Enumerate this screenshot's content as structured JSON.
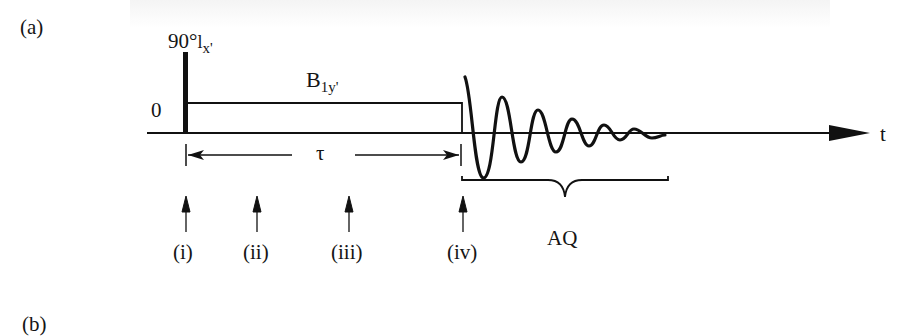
{
  "figure": {
    "panel_a_label": "(a)",
    "panel_b_label": "(b)",
    "pulse": {
      "angle": "90°",
      "phase_symbol": "l",
      "axis_subscript": "x'"
    },
    "spin_lock": {
      "label": "B",
      "subscript": "1y'"
    },
    "zero_level_label": "0",
    "time_axis_label": "t",
    "delay_label": "τ",
    "acquisition_label": "AQ",
    "time_points": [
      {
        "label": "(i)"
      },
      {
        "label": "(ii)"
      },
      {
        "label": "(iii)"
      },
      {
        "label": "(iv)"
      }
    ],
    "colors": {
      "ink": "#111111",
      "background": "#ffffff"
    }
  }
}
